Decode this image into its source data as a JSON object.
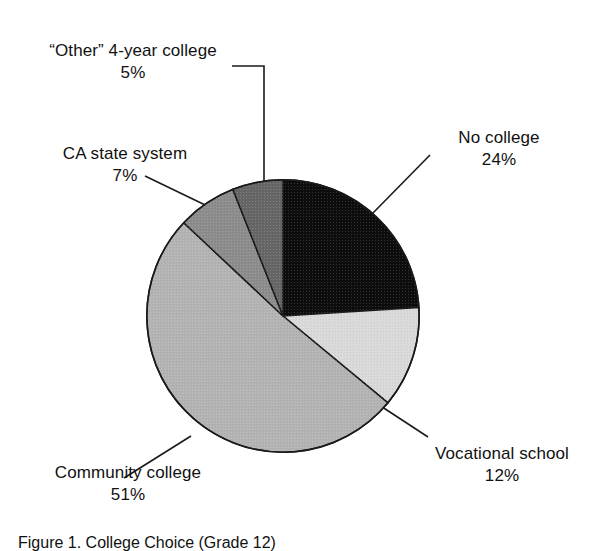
{
  "figure": {
    "caption": "Figure 1.  College Choice (Grade 12)",
    "background_color": "#ffffff",
    "text_color": "#111111"
  },
  "chart_data": {
    "type": "pie",
    "title": "",
    "xlabel": "",
    "ylabel": "",
    "units": "percent",
    "total": 99,
    "legend_position": "callout-labels",
    "grid": false,
    "start_angle_deg": 0,
    "direction": "clockwise",
    "categories": [
      "No college",
      "Vocational school",
      "Community college",
      "CA state system",
      "“Other” 4-year college"
    ],
    "values": [
      24,
      12,
      51,
      7,
      5
    ],
    "value_labels": [
      "24%",
      "12%",
      "51%",
      "7%",
      "5%"
    ],
    "colors": [
      "#0d0d0d",
      "#d9d9d9",
      "#b3b3b3",
      "#8c8c8c",
      "#666666"
    ],
    "slices": [
      {
        "label": "No college",
        "value": 24,
        "value_label": "24%",
        "color": "#0d0d0d",
        "start_angle_deg": 0,
        "end_angle_deg": 86.4
      },
      {
        "label": "Vocational school",
        "value": 12,
        "value_label": "12%",
        "color": "#d9d9d9",
        "start_angle_deg": 86.4,
        "end_angle_deg": 129.6
      },
      {
        "label": "Community college",
        "value": 51,
        "value_label": "51%",
        "color": "#b3b3b3",
        "start_angle_deg": 129.6,
        "end_angle_deg": 313.2
      },
      {
        "label": "CA state system",
        "value": 7,
        "value_label": "7%",
        "color": "#8c8c8c",
        "start_angle_deg": 313.2,
        "end_angle_deg": 338.4
      },
      {
        "label": "“Other” 4-year college",
        "value": 5,
        "value_label": "5%",
        "color": "#666666",
        "start_angle_deg": 338.4,
        "end_angle_deg": 360
      }
    ]
  },
  "labels": {
    "other_4year": {
      "name": "“Other” 4-year college",
      "value": "5%"
    },
    "ca_state": {
      "name": "CA state system",
      "value": "7%"
    },
    "no_college": {
      "name": "No college",
      "value": "24%"
    },
    "vocational": {
      "name": "Vocational school",
      "value": "12%"
    },
    "community": {
      "name": "Community college",
      "value": "51%"
    }
  }
}
